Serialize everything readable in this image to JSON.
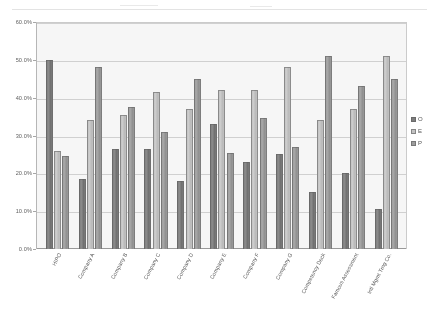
{
  "chart_data": {
    "type": "bar",
    "title": "",
    "xlabel": "",
    "ylabel": "",
    "ylim": [
      0,
      60
    ],
    "ytick_labels": [
      "60.0%",
      "50.0%",
      "40.0%",
      "30.0%",
      "20.0%",
      "10.0%",
      "0.0%"
    ],
    "ytick_values": [
      60,
      50,
      40,
      30,
      20,
      10,
      0
    ],
    "grid": true,
    "legend_position": "right",
    "categories": [
      "HIPO",
      "Company A",
      "Company B",
      "Company C",
      "Company D",
      "Company E",
      "Company F",
      "Company G",
      "Competency Deck",
      "Famous Assessment",
      "Intl Mgmt Trng Co."
    ],
    "series": [
      {
        "name": "O",
        "color": "#7b7b7b",
        "values": [
          50.0,
          18.5,
          26.5,
          26.5,
          18.0,
          33.0,
          23.0,
          25.0,
          15.0,
          20.0,
          10.5
        ]
      },
      {
        "name": "E",
        "color": "#c6c6c6",
        "values": [
          26.0,
          34.0,
          35.5,
          41.5,
          37.0,
          42.0,
          42.0,
          48.0,
          34.0,
          37.0,
          51.0
        ]
      },
      {
        "name": "P",
        "color": "#9e9e9e",
        "values": [
          24.5,
          48.0,
          37.5,
          31.0,
          45.0,
          25.5,
          34.5,
          27.0,
          51.0,
          43.0,
          45.0
        ]
      }
    ]
  },
  "legend": {
    "items": [
      {
        "label": "O",
        "color": "#7b7b7b"
      },
      {
        "label": "E",
        "color": "#c6c6c6"
      },
      {
        "label": "P",
        "color": "#9e9e9e"
      }
    ]
  }
}
